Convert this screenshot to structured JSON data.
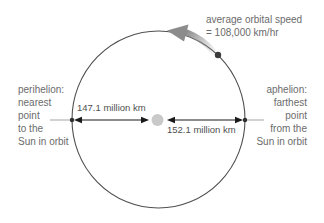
{
  "diagram": {
    "speed_label": {
      "line1": "average orbital speed",
      "line2": "= 108,000 km/hr"
    },
    "perihelion_label": {
      "line1": "perihelion:",
      "line2": "nearest",
      "line3": "point",
      "line4": "to the",
      "line5": "Sun in orbit"
    },
    "aphelion_label": {
      "line1": "aphelion:",
      "line2": "farthest",
      "line3": "point",
      "line4": "from the",
      "line5": "Sun in orbit"
    },
    "perihelion_distance": "147.1 million km",
    "aphelion_distance": "152.1 million km",
    "colors": {
      "orbit_stroke": "#4f4f4f",
      "label_text": "#6b6b6b",
      "distance_text": "#4f4f4f",
      "sun_fill": "#c9c9c9",
      "earth_fill": "#3c3c3c",
      "velocity_arrow": "#8c8c8c",
      "measure_arrow": "#1a1a1a",
      "leader_line": "#9b9b9b"
    }
  }
}
